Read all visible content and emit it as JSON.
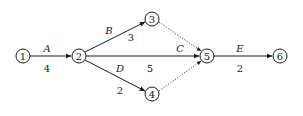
{
  "diagram": {
    "type": "activity-on-arrow network",
    "colors": {
      "stroke": "#1a1a1a",
      "background": "#ffffff"
    },
    "nodes": [
      {
        "id": "1",
        "label": "1",
        "x": 23,
        "y": 56
      },
      {
        "id": "2",
        "label": "2",
        "x": 79,
        "y": 56
      },
      {
        "id": "3",
        "label": "3",
        "x": 152,
        "y": 19
      },
      {
        "id": "4",
        "label": "4",
        "x": 152,
        "y": 94
      },
      {
        "id": "5",
        "label": "5",
        "x": 207,
        "y": 56
      },
      {
        "id": "6",
        "label": "6",
        "x": 280,
        "y": 56
      }
    ],
    "edges": [
      {
        "from": "1",
        "to": "2",
        "activity": "A",
        "duration": "4",
        "style": "solid"
      },
      {
        "from": "2",
        "to": "3",
        "activity": "B",
        "duration": "3",
        "style": "solid"
      },
      {
        "from": "2",
        "to": "5",
        "activity": "C",
        "duration": "5",
        "style": "solid"
      },
      {
        "from": "2",
        "to": "4",
        "activity": "D",
        "duration": "2",
        "style": "solid"
      },
      {
        "from": "5",
        "to": "6",
        "activity": "E",
        "duration": "2",
        "style": "solid"
      },
      {
        "from": "3",
        "to": "5",
        "activity": "",
        "duration": "",
        "style": "dotted"
      },
      {
        "from": "4",
        "to": "5",
        "activity": "",
        "duration": "",
        "style": "dotted"
      }
    ]
  }
}
